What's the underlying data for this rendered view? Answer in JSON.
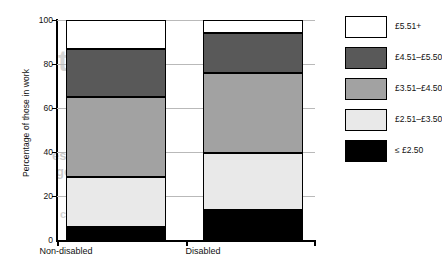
{
  "chart_data": {
    "type": "bar",
    "subtype": "stacked-vertical-100",
    "title": "",
    "xlabel": "",
    "ylabel": "Percentage of those in work",
    "categories": [
      "Non-disabled",
      "Disabled"
    ],
    "ylim": [
      0,
      100
    ],
    "yticks": [
      0,
      20,
      40,
      60,
      80,
      100
    ],
    "ytick_labels": [
      "0",
      "20",
      "40",
      "60",
      "80",
      "100"
    ],
    "grid": true,
    "legend_position": "right",
    "stack_order_bottom_to_top": [
      "≤ £2.50",
      "£2.51–£3.50",
      "£3.51–£4.50",
      "£4.51–£5.50",
      "£5.51+"
    ],
    "series": [
      {
        "name": "≤ £2.50",
        "color": "#000000",
        "values": [
          6,
          13.5
        ]
      },
      {
        "name": "£2.51–£3.50",
        "color": "#e9e9e9",
        "values": [
          22.5,
          26
        ]
      },
      {
        "name": "£3.51–£4.50",
        "color": "#a2a2a2",
        "values": [
          36.5,
          36.5
        ]
      },
      {
        "name": "£4.51–£5.50",
        "color": "#595959",
        "values": [
          22,
          18
        ]
      },
      {
        "name": "£5.51+",
        "color": "#ffffff",
        "values": [
          13,
          6
        ]
      }
    ],
    "cumulative_tops": {
      "Non-disabled": [
        6,
        28.5,
        65,
        87,
        100
      ],
      "Disabled": [
        13.5,
        39.5,
        76,
        94,
        100
      ]
    }
  },
  "legend": {
    "items": [
      {
        "label": "£5.51+",
        "swatch": "s-white"
      },
      {
        "label": "£4.51–£5.50",
        "swatch": "s-dark"
      },
      {
        "label": "£3.51–£4.50",
        "swatch": "s-mid"
      },
      {
        "label": "£2.51–£3.50",
        "swatch": "s-light"
      },
      {
        "label": "≤ £2.50",
        "swatch": "s-black"
      }
    ]
  },
  "background_text": {
    "line1": "tents",
    "line2": "es, figures and",
    "line3": "gements",
    "line4": "ction"
  },
  "colors": {
    "band_5": "#ffffff",
    "band_4": "#595959",
    "band_3": "#a2a2a2",
    "band_2": "#e9e9e9",
    "band_1": "#000000",
    "grid": "#b9b9b9",
    "axis": "#000000"
  }
}
